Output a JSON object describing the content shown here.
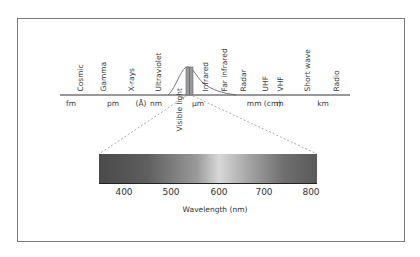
{
  "diagram": {
    "regions": [
      {
        "label": "Cosmic",
        "x": 80
      },
      {
        "label": "Gamma",
        "x": 103
      },
      {
        "label": "X-rays",
        "x": 131
      },
      {
        "label": "Ultraviolet",
        "x": 158
      },
      {
        "label": "Infrared",
        "x": 205
      },
      {
        "label": "Far infrared",
        "x": 224
      },
      {
        "label": "Radar",
        "x": 243
      },
      {
        "label": "UHF",
        "x": 265
      },
      {
        "label": "VHF",
        "x": 280
      },
      {
        "label": "Short wave",
        "x": 307
      },
      {
        "label": "Radio",
        "x": 336
      }
    ],
    "units": [
      {
        "label": "fm",
        "x": 71
      },
      {
        "label": "pm",
        "x": 113
      },
      {
        "label": "(Å)",
        "x": 141
      },
      {
        "label": "nm",
        "x": 156
      },
      {
        "label": "µm",
        "x": 198
      },
      {
        "label": "mm (cm)",
        "x": 264
      },
      {
        "label": "m",
        "x": 280
      },
      {
        "label": "km",
        "x": 323
      }
    ],
    "visible_label": "Visible light",
    "visible_band": {
      "ticks": [
        "400",
        "500",
        "600",
        "700",
        "800"
      ],
      "xlabel": "Wavelength (nm)",
      "gradient_stops": [
        "#4a4a4a",
        "#5e5e5e",
        "#9a9a9a",
        "#d8d8d8",
        "#a0a0a0",
        "#6e6e6e",
        "#5a5a5a"
      ]
    },
    "colors": {
      "border": "#7a7a7a",
      "axis": "#333333",
      "dash": "#aaaaaa",
      "band_fill": "#888888"
    }
  }
}
